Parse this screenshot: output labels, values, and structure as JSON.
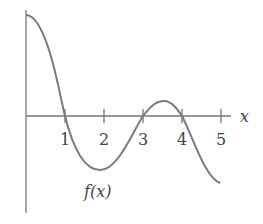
{
  "chart_data": {
    "type": "line",
    "title": "",
    "xlabel": "x",
    "ylabel": "",
    "curve_label": "f(x)",
    "x_ticks": [
      "1",
      "2",
      "3",
      "4",
      "5"
    ],
    "xlim": [
      0,
      5
    ],
    "grid": false,
    "series": [
      {
        "name": "f(x)",
        "x": [
          0,
          0.5,
          1,
          1.5,
          1.9,
          2.5,
          3,
          3.5,
          4,
          4.5,
          5
        ],
        "y": [
          1.0,
          0.65,
          0,
          -0.5,
          -0.55,
          -0.3,
          0,
          0.15,
          0,
          -0.4,
          -0.6
        ]
      }
    ],
    "zeros": [
      1,
      3,
      4
    ],
    "color": "#777777"
  }
}
